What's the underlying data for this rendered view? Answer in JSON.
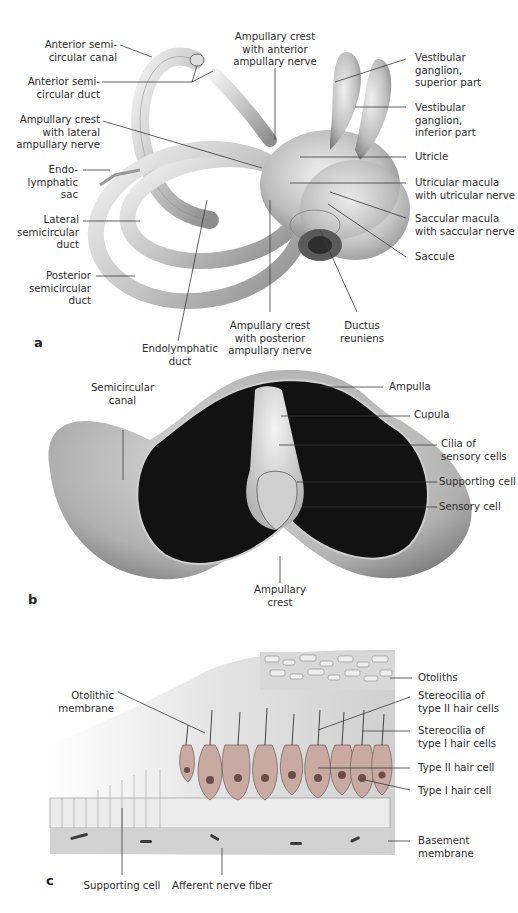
{
  "figure": {
    "panels": [
      {
        "letter": "a",
        "title": "Membranous labyrinth"
      },
      {
        "letter": "b",
        "title": "Ampulla cross-section"
      },
      {
        "letter": "c",
        "title": "Macula structure"
      }
    ]
  },
  "panel_a": {
    "letter": "a",
    "labels": {
      "anterior_canal": "Anterior semi-\ncircular canal",
      "anterior_duct": "Anterior semi-\ncircular duct",
      "crest_lateral": "Ampullary crest\nwith lateral\nampullary nerve",
      "endo_sac": "Endo-\nlymphatic\nsac",
      "lateral_duct": "Lateral\nsemicircular\nduct",
      "posterior_duct": "Posterior\nsemicircular\nduct",
      "endo_duct": "Endolymphatic\nduct",
      "crest_posterior": "Ampullary crest\nwith posterior\nampullary nerve",
      "ductus_reuniens": "Ductus\nreuniens",
      "crest_anterior": "Ampullary crest\nwith anterior\nampullary nerve",
      "ganglion_superior": "Vestibular\nganglion,\nsuperior part",
      "ganglion_inferior": "Vestibular\nganglion,\ninferior part",
      "utricle": "Utricle",
      "utricular_macula": "Utricular macula\nwith utricular nerve",
      "saccular_macula": "Saccular macula\nwith saccular nerve",
      "saccule": "Saccule"
    }
  },
  "panel_b": {
    "letter": "b",
    "labels": {
      "semicircular_canal": "Semicircular\ncanal",
      "ampulla": "Ampulla",
      "cupula": "Cupula",
      "cilia": "Cilia of\nsensory cells",
      "supporting_cell": "Supporting cell",
      "sensory_cell": "Sensory cell",
      "ampullary_crest": "Ampullary\ncrest"
    }
  },
  "panel_c": {
    "letter": "c",
    "labels": {
      "otoliths": "Otoliths",
      "otolithic_membrane": "Otolithic\nmembrane",
      "stereocilia_type2": "Stereocilia of\ntype II hair cells",
      "stereocilia_type1": "Stereocilia of\ntype I hair cells",
      "type2_cell": "Type II hair cell",
      "type1_cell": "Type I hair cell",
      "basement_membrane": "Basement\nmembrane",
      "supporting_cell": "Supporting cell",
      "afferent_fiber": "Afferent nerve fiber"
    }
  },
  "colors": {
    "tissue_light": "#e6e6e6",
    "tissue_mid": "#b8b8b8",
    "tissue_dark": "#777777",
    "lumen": "#111111",
    "hair_cell": "#c9aaa2",
    "line": "#3a3a3a"
  }
}
